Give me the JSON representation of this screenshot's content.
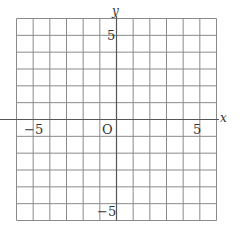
{
  "chart_data": {
    "type": "scatter",
    "title": "",
    "xlabel": "x",
    "ylabel": "y",
    "xlim": [
      -6,
      6
    ],
    "ylim": [
      -6,
      6
    ],
    "grid": true,
    "grid_step": 1,
    "x_ticks_labeled": [
      -5,
      5
    ],
    "y_ticks_labeled": [
      5,
      -5
    ],
    "origin_label": "O",
    "series": []
  },
  "labels": {
    "x_axis": "x",
    "y_axis": "y",
    "origin": "O",
    "x_neg5": "−5",
    "x_pos5": "5",
    "y_pos5": "5",
    "y_neg5": "−5"
  },
  "colors": {
    "grid": "#8a8a8a",
    "axis": "#555555",
    "text": "#333333"
  }
}
